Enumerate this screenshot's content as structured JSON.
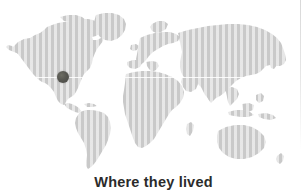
{
  "figure": {
    "caption": "Where they lived",
    "background_color": "#ffffff"
  },
  "map": {
    "type": "world-map",
    "land_color": "#c9c9c9",
    "land_texture": "halftone-screen",
    "ocean_color": "#ffffff",
    "latitude_line_label": "equator",
    "regions": [
      "North America",
      "Greenland",
      "South America",
      "Europe",
      "Africa",
      "Asia",
      "Australia"
    ]
  },
  "marker": {
    "label": "location-marker",
    "color": "#55554f",
    "region": "Western United States",
    "diameter_px": 12,
    "center_x_px": 63,
    "center_y_px": 77
  },
  "artifacts": {
    "scan_line_color": "#dddddd"
  }
}
